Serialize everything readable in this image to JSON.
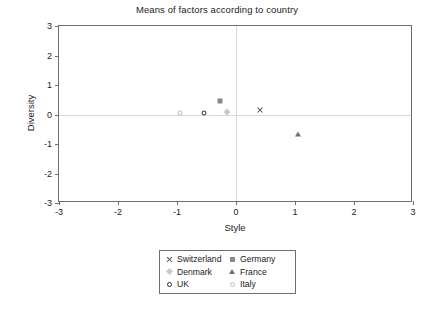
{
  "chart_data": {
    "type": "scatter",
    "title": "Means of factors according to country",
    "xlabel": "Style",
    "ylabel": "Diversity",
    "xlim": [
      -3,
      3
    ],
    "ylim": [
      -3,
      3
    ],
    "xticks": [
      "-3",
      "-2",
      "-1",
      "0",
      "1",
      "2",
      "3"
    ],
    "yticks": [
      "3",
      "2",
      "1",
      "0",
      "-1",
      "-2",
      "-3"
    ],
    "xtick_values": [
      -3,
      -2,
      -1,
      0,
      1,
      2,
      3
    ],
    "ytick_values": [
      3,
      2,
      1,
      0,
      -1,
      -2,
      -3
    ],
    "grid": false,
    "zero_lines": true,
    "legend_position": "below-center",
    "series": [
      {
        "name": "Switzerland",
        "marker": "cross-x",
        "color": "#555555",
        "x": 0.4,
        "y": 0.15
      },
      {
        "name": "Germany",
        "marker": "square",
        "color": "#8a8a8a",
        "x": -0.27,
        "y": 0.45
      },
      {
        "name": "Denmark",
        "marker": "diamond",
        "color": "#c9c9c9",
        "x": -0.15,
        "y": 0.1
      },
      {
        "name": "France",
        "marker": "triangle",
        "color": "#6f6f6f",
        "x": 1.05,
        "y": -0.65
      },
      {
        "name": "UK",
        "marker": "circle-open",
        "color": "#2b2b2b",
        "x": -0.55,
        "y": 0.05
      },
      {
        "name": "Italy",
        "marker": "circle-open",
        "color": "#bcbcbc",
        "x": -0.95,
        "y": 0.05
      }
    ]
  },
  "legend": {
    "entries": [
      {
        "label": "Switzerland",
        "marker": "cross-x",
        "color": "#555555"
      },
      {
        "label": "Germany",
        "marker": "square",
        "color": "#8a8a8a"
      },
      {
        "label": "Denmark",
        "marker": "diamond",
        "color": "#c9c9c9"
      },
      {
        "label": "France",
        "marker": "triangle",
        "color": "#6f6f6f"
      },
      {
        "label": "UK",
        "marker": "circle-open",
        "color": "#2b2b2b"
      },
      {
        "label": "Italy",
        "marker": "circle-open",
        "color": "#bcbcbc"
      }
    ]
  },
  "style": {
    "frame_color": "#6e6e6e",
    "zero_line_color": "#d8d8d8",
    "text_color": "#1b1b1b",
    "background": "#ffffff"
  }
}
